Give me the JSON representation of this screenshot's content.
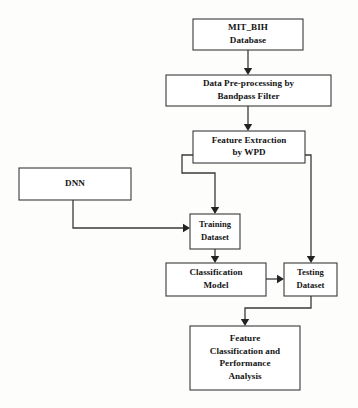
{
  "diagram": {
    "background_color": "#fdfdfc",
    "line_color": "#3a3a3a",
    "text_color": "#141414",
    "nodes": [
      {
        "id": "mit_bih_database",
        "lines": [
          "MIT_BIH",
          "Database"
        ],
        "x": 193,
        "y": 19,
        "w": 110,
        "h": 31
      },
      {
        "id": "data_preprocessing",
        "lines": [
          "Data Pre-processing by",
          "Bandpass Filter"
        ],
        "x": 166,
        "y": 75,
        "w": 165,
        "h": 31
      },
      {
        "id": "feature_extraction",
        "lines": [
          "Feature Extraction",
          "by WPD"
        ],
        "x": 193,
        "y": 131,
        "w": 112,
        "h": 32
      },
      {
        "id": "dnn",
        "lines": [
          "DNN"
        ],
        "x": 19,
        "y": 168,
        "w": 112,
        "h": 32
      },
      {
        "id": "training_dataset",
        "lines": [
          "Training",
          "Dataset"
        ],
        "x": 190,
        "y": 214,
        "w": 50,
        "h": 35
      },
      {
        "id": "classification_model",
        "lines": [
          "Classification",
          "Model"
        ],
        "x": 166,
        "y": 263,
        "w": 100,
        "h": 33
      },
      {
        "id": "testing_dataset",
        "lines": [
          "Testing",
          "Dataset"
        ],
        "x": 284,
        "y": 263,
        "w": 53,
        "h": 33
      },
      {
        "id": "feature_classification",
        "lines": [
          "Feature",
          "Classification and",
          "Performance",
          "Analysis"
        ],
        "x": 190,
        "y": 326,
        "w": 110,
        "h": 64
      }
    ],
    "edges": [
      {
        "id": "database-to-preprocessing",
        "from": "mit_bih_database",
        "to": "data_preprocessing",
        "path": "M 248 50 L 248 69",
        "arrow_at": [
          248,
          75
        ],
        "arrow_dir": "down"
      },
      {
        "id": "preprocessing-to-extraction",
        "from": "data_preprocessing",
        "to": "feature_extraction",
        "path": "M 248 106 L 248 125",
        "arrow_at": [
          248,
          131
        ],
        "arrow_dir": "down"
      },
      {
        "id": "extraction-to-training",
        "from": "feature_extraction",
        "to": "training_dataset",
        "path": "M 193 155 L 182 155 L 182 173 L 215 173 L 215 208",
        "arrow_at": [
          215,
          214
        ],
        "arrow_dir": "down"
      },
      {
        "id": "extraction-to-testing",
        "from": "feature_extraction",
        "to": "testing_dataset",
        "path": "M 305 155 L 311 155 L 311 257",
        "arrow_at": [
          311,
          263
        ],
        "arrow_dir": "down"
      },
      {
        "id": "dnn-to-training",
        "from": "dnn",
        "to": "training_dataset",
        "path": "M 73 200 L 73 228 L 184 228",
        "arrow_at": [
          190,
          228
        ],
        "arrow_dir": "right"
      },
      {
        "id": "training-to-classification",
        "from": "training_dataset",
        "to": "classification_model",
        "path": "M 215 249 L 215 257",
        "arrow_at": [
          215,
          263
        ],
        "arrow_dir": "down"
      },
      {
        "id": "classification-to-testing",
        "from": "classification_model",
        "to": "testing_dataset",
        "path": "M 266 279 L 278 279",
        "arrow_at": [
          284,
          279
        ],
        "arrow_dir": "right"
      },
      {
        "id": "testing-to-feature-classification",
        "from": "testing_dataset",
        "to": "feature_classification",
        "path": "M 311 296 L 311 308 L 245 308 L 245 320",
        "arrow_at": [
          245,
          326
        ],
        "arrow_dir": "down"
      }
    ]
  }
}
